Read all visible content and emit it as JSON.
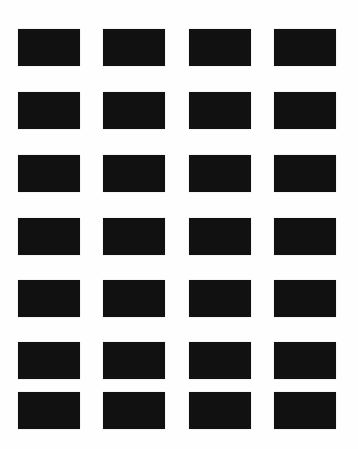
{
  "page": {
    "background": "#ffffff",
    "tile_color": "#111111",
    "layout": {
      "columns": 4,
      "rows": 7
    },
    "column_x": [
      18,
      103,
      189,
      274
    ],
    "row_y": [
      29,
      92,
      155,
      218,
      280,
      342,
      392
    ],
    "tile_size": {
      "width": 62,
      "height": 37
    }
  },
  "tiles": [
    {
      "row": 1,
      "col": 1,
      "caption": ""
    },
    {
      "row": 1,
      "col": 2,
      "caption": ""
    },
    {
      "row": 1,
      "col": 3,
      "caption": ""
    },
    {
      "row": 1,
      "col": 4,
      "caption": ""
    },
    {
      "row": 2,
      "col": 1,
      "caption": ""
    },
    {
      "row": 2,
      "col": 2,
      "caption": ""
    },
    {
      "row": 2,
      "col": 3,
      "caption": ""
    },
    {
      "row": 2,
      "col": 4,
      "caption": ""
    },
    {
      "row": 3,
      "col": 1,
      "caption": ""
    },
    {
      "row": 3,
      "col": 2,
      "caption": ""
    },
    {
      "row": 3,
      "col": 3,
      "caption": ""
    },
    {
      "row": 3,
      "col": 4,
      "caption": ""
    },
    {
      "row": 4,
      "col": 1,
      "caption": ""
    },
    {
      "row": 4,
      "col": 2,
      "caption": ""
    },
    {
      "row": 4,
      "col": 3,
      "caption": ""
    },
    {
      "row": 4,
      "col": 4,
      "caption": ""
    },
    {
      "row": 5,
      "col": 1,
      "caption": ""
    },
    {
      "row": 5,
      "col": 2,
      "caption": ""
    },
    {
      "row": 5,
      "col": 3,
      "caption": ""
    },
    {
      "row": 5,
      "col": 4,
      "caption": ""
    },
    {
      "row": 6,
      "col": 1,
      "caption": ""
    },
    {
      "row": 6,
      "col": 2,
      "caption": ""
    },
    {
      "row": 6,
      "col": 3,
      "caption": ""
    },
    {
      "row": 6,
      "col": 4,
      "caption": ""
    },
    {
      "row": 7,
      "col": 1,
      "caption": ""
    },
    {
      "row": 7,
      "col": 2,
      "caption": ""
    },
    {
      "row": 7,
      "col": 3,
      "caption": ""
    },
    {
      "row": 7,
      "col": 4,
      "caption": ""
    }
  ]
}
